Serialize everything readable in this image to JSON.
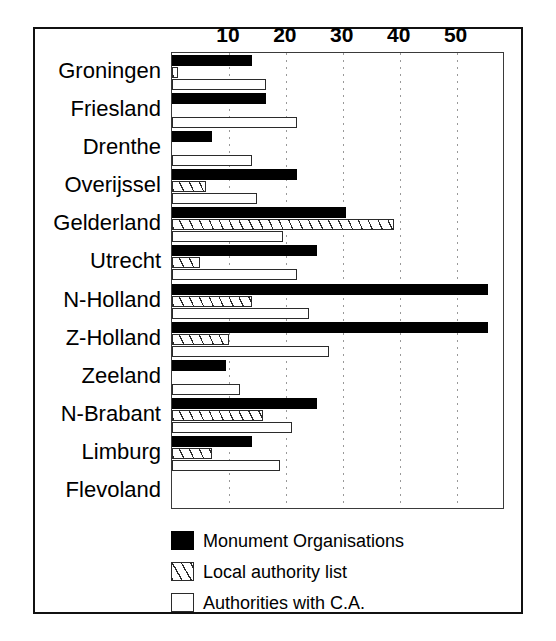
{
  "chart_data": {
    "type": "bar",
    "orientation": "horizontal",
    "title": "",
    "subtitle": "",
    "xlabel": "",
    "ylabel": "",
    "xlim": [
      0,
      58.5
    ],
    "ylim": null,
    "grid": true,
    "grid_axis": "x",
    "legend_position": "bottom-left",
    "xticks": [
      10,
      20,
      30,
      40,
      50
    ],
    "xtick_labels": [
      "10",
      "20",
      "30",
      "40",
      "50"
    ],
    "categories": [
      "Groningen",
      "Friesland",
      "Drenthe",
      "Overijssel",
      "Gelderland",
      "Utrecht",
      "N-Holland",
      "Z-Holland",
      "Zeeland",
      "N-Brabant",
      "Limburg",
      "Flevoland"
    ],
    "series": [
      {
        "name": "Monument Organisations",
        "pattern": "solid-black",
        "color": "#000000",
        "values": [
          14,
          16.5,
          7,
          22,
          30.5,
          25.5,
          55.5,
          55.5,
          9.5,
          25.5,
          14,
          0
        ]
      },
      {
        "name": "Local authority list",
        "pattern": "diagonal-hatch",
        "color": "#2b2b2b",
        "values": [
          1,
          0,
          0,
          6,
          39,
          5,
          14,
          10,
          0,
          16,
          7,
          0
        ]
      },
      {
        "name": "Authorities with C.A.",
        "pattern": "dotted",
        "color": "#2b2b2b",
        "values": [
          16.5,
          22,
          14,
          15,
          19.5,
          22,
          24,
          27.5,
          12,
          21,
          19,
          0
        ]
      }
    ]
  },
  "legend": {
    "items": [
      {
        "label": "Monument Organisations",
        "swatch": "solid-black-swatch"
      },
      {
        "label": "Local authority list",
        "swatch": "diagonal-hatch-swatch"
      },
      {
        "label": "Authorities with C.A.",
        "swatch": "dotted-swatch"
      }
    ]
  }
}
